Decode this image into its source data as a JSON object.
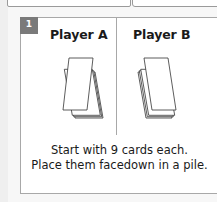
{
  "step": {
    "number": "1",
    "players": [
      {
        "label": "Player A",
        "icon": "card-pile-icon"
      },
      {
        "label": "Player B",
        "icon": "card-pile-icon"
      }
    ],
    "caption_line1": "Start with 9 cards each.",
    "caption_line2": "Place them facedown in a pile."
  },
  "colors": {
    "badge": "#7a7a7a",
    "border": "#a8a8a8",
    "background": "#f7f7f7",
    "text": "#1a1a1a"
  }
}
